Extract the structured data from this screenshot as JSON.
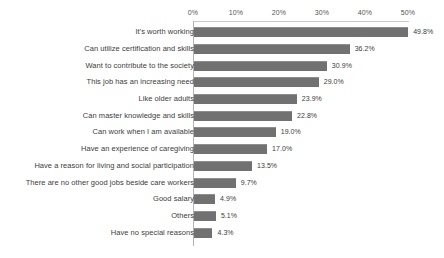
{
  "chart_data": {
    "type": "bar",
    "orientation": "horizontal",
    "title": "",
    "xlabel": "",
    "ylabel": "",
    "xlim": [
      0,
      50
    ],
    "xticks": [
      "0%",
      "10%",
      "20%",
      "30%",
      "40%",
      "50%"
    ],
    "xtick_values": [
      0,
      10,
      20,
      30,
      40,
      50
    ],
    "grid": false,
    "legend": null,
    "value_suffix": "%",
    "categories": [
      "It's worth working",
      "Can utilize certification and skills",
      "Want to contribute to the society",
      "This job has an increasing need",
      "Like older adults",
      "Can master knowledge and skills",
      "Can work when I am available",
      "Have an experience of caregiving",
      "Have a reason for living and social participation",
      "There are no other good jobs beside care workers",
      "Good salary",
      "Others",
      "Have no special reasons"
    ],
    "values": [
      49.8,
      36.2,
      30.9,
      29.0,
      23.9,
      22.8,
      19.0,
      17.0,
      13.5,
      9.7,
      4.9,
      5.1,
      4.3
    ],
    "value_labels": [
      "49.8%",
      "36.2%",
      "30.9%",
      "29.0%",
      "23.9%",
      "22.8%",
      "19.0%",
      "17.0%",
      "13.5%",
      "9.7%",
      "4.9%",
      "5.1%",
      "4.3%"
    ],
    "bar_color": "#717171",
    "text_color": "#3c3c3c",
    "axis_color": "#b4b4b4",
    "background": "#ffffff"
  }
}
